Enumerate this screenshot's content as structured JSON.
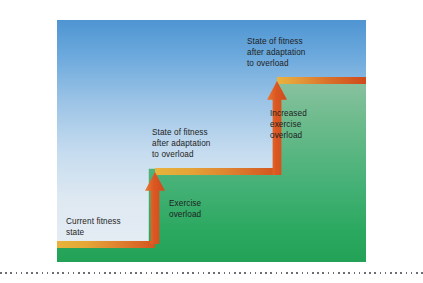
{
  "figure": {
    "labels": {
      "current_fitness_state": "Current fitness\nstate",
      "exercise_overload": "Exercise\noverload",
      "state_after_adaptation_mid": "State of fitness\nafter adaptation\nto overload",
      "increased_exercise_overload": "Increased\nexercise\noverload",
      "state_after_adaptation_top": "State of fitness\nafter adaptation\nto overload"
    },
    "colors": {
      "sky_top": "#4f95d2",
      "sky_bottom": "#e6edf4",
      "ground_top": "#b9d2c4",
      "ground_bottom": "#23a257",
      "band_left": "#e8b33c",
      "band_right": "#d1511e",
      "arrow": "#db5722",
      "text": "#1d1d22",
      "rule": "#6d6d74"
    }
  },
  "chart_data": {
    "type": "bar",
    "xlabel": "",
    "ylabel": "State of fitness",
    "categories": [
      "Current fitness state",
      "State of fitness after adaptation to overload",
      "State of fitness after adaptation to overload"
    ],
    "values": [
      1,
      2,
      3
    ],
    "ylim": [
      0,
      3
    ],
    "grid": false,
    "legend": null,
    "annotations": [
      "Exercise overload",
      "Increased exercise overload"
    ]
  }
}
